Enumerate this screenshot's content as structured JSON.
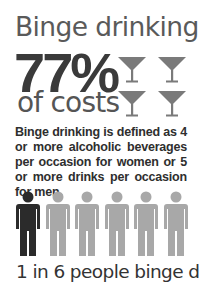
{
  "title": "Binge drinking",
  "stat": {
    "value": "77%",
    "label": "of costs"
  },
  "description": "Binge drinking is defined as 4 or more alcoholic beverages per occasion for women or 5 or more drinks per occasion for men.",
  "icons": {
    "glasses": [
      "martini-glass-icon",
      "martini-glass-icon",
      "martini-glass-icon",
      "martini-glass-icon"
    ],
    "people": [
      {
        "icon": "person-icon",
        "highlighted": true
      },
      {
        "icon": "person-icon",
        "highlighted": false
      },
      {
        "icon": "person-icon",
        "highlighted": false
      },
      {
        "icon": "person-icon",
        "highlighted": false
      },
      {
        "icon": "person-icon",
        "highlighted": false
      },
      {
        "icon": "person-icon",
        "highlighted": false
      }
    ]
  },
  "caption": "1 in 6 people binge drink",
  "colors": {
    "highlight_person": "#2b2b2b",
    "other_person": "#a8a8a8",
    "glass": "#7a7a7a",
    "title_text": "#5a5a5a",
    "stat_text": "#3a3a3a"
  }
}
